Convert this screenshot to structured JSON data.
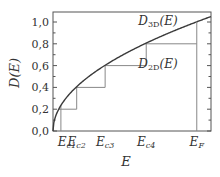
{
  "chart_data": {
    "type": "line",
    "title": "",
    "xlabel": "E",
    "ylabel": "D(E)",
    "ylim": [
      0.0,
      1.1
    ],
    "yticks": [
      0.0,
      0.2,
      0.4,
      0.6,
      0.8,
      1.0
    ],
    "ytick_labels": [
      "0,0",
      "0,2",
      "0,4",
      "0,6",
      "0,8",
      "1,0"
    ],
    "xtick_labels": [
      {
        "base": "E",
        "sub": "c1"
      },
      {
        "base": "E",
        "sub": "c2"
      },
      {
        "base": "E",
        "sub": "c3"
      },
      {
        "base": "E",
        "sub": "c4"
      },
      {
        "base": "E",
        "sub": "F"
      }
    ],
    "x_positions_norm": {
      "E0": 0.0,
      "Ec1": 0.05,
      "Ec2": 0.15,
      "Ec3": 0.33,
      "Ec4": 0.59,
      "EF": 0.91,
      "Emax": 1.0
    },
    "series": [
      {
        "name": "D_3D(E)",
        "kind": "curve",
        "formula": "1.05*sqrt(x)",
        "description": "3D density of states, square-root growth"
      },
      {
        "name": "D_2D(E)",
        "kind": "step",
        "steps": [
          {
            "x_start": 0.05,
            "x_end": 0.15,
            "y": 0.2
          },
          {
            "x_start": 0.15,
            "x_end": 0.33,
            "y": 0.4
          },
          {
            "x_start": 0.33,
            "x_end": 0.59,
            "y": 0.6
          },
          {
            "x_start": 0.59,
            "x_end": 0.91,
            "y": 0.8
          }
        ],
        "description": "Quasi-2D step density of states"
      }
    ],
    "annotations": [
      {
        "text_base": "D",
        "text_sub": "3D",
        "text_suffix": "(E)",
        "anchor": "above curve, upper right"
      },
      {
        "text_base": "D",
        "text_sub": "2D",
        "text_suffix": "(E)",
        "anchor": "below step, right of Ec4"
      }
    ],
    "fermi_line": {
      "x": 0.91,
      "label": "E_F"
    },
    "grid": false,
    "legend": "none",
    "colors": {
      "curve": "#3a3a3a",
      "steps": "#888888",
      "axis": "#555555",
      "text": "#333333"
    }
  }
}
